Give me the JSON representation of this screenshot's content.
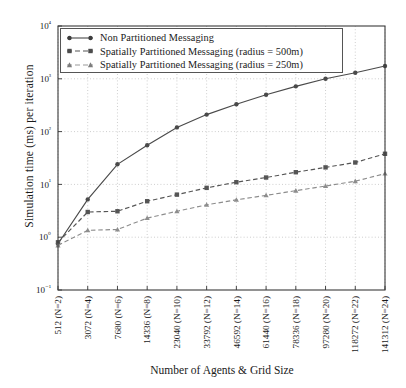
{
  "chart_data": {
    "type": "line",
    "title": "",
    "xlabel": "Number of Agents & Grid Size",
    "ylabel": "Simulation time (ms) per iteration",
    "yscale": "log",
    "ylim": [
      0.1,
      10000
    ],
    "ytick_labels": [
      "10⁴",
      "10³",
      "10²",
      "10¹",
      "10⁰",
      "10⁻¹"
    ],
    "ytick_values": [
      10000,
      1000,
      100,
      10,
      1,
      0.1
    ],
    "grid": true,
    "legend_position": "upper left",
    "categories": [
      "512 (N=2)",
      "3072 (N=4)",
      "7680 (N=6)",
      "14336 (N=8)",
      "23040 (N=10)",
      "33792 (N=12)",
      "46592 (N=14)",
      "61440 (N=16)",
      "78336 (N=18)",
      "97280 (N=20)",
      "118272 (N=22)",
      "141312 (N=24)"
    ],
    "x_agents": [
      512,
      3072,
      7680,
      14336,
      23040,
      33792,
      46592,
      61440,
      78336,
      97280,
      118272,
      141312
    ],
    "x_grid_n": [
      2,
      4,
      6,
      8,
      10,
      12,
      14,
      16,
      18,
      20,
      22,
      24
    ],
    "series": [
      {
        "name": "Non Partitioned Messaging",
        "marker": "circle",
        "linestyle": "solid",
        "color": "#4a4a4a",
        "values": [
          0.75,
          5.2,
          24.0,
          55.0,
          120.0,
          210.0,
          330.0,
          500.0,
          720.0,
          1000.0,
          1300.0,
          1750.0
        ]
      },
      {
        "name": "Spatially Partitioned Messaging (radius = 500m)",
        "marker": "square",
        "linestyle": "dashed",
        "color": "#555555",
        "values": [
          0.8,
          3.0,
          3.1,
          4.8,
          6.4,
          8.6,
          11.0,
          13.5,
          17.0,
          21.0,
          26.0,
          38.0
        ]
      },
      {
        "name": "Spatially Partitioned Messaging (radius = 250m)",
        "marker": "triangle",
        "linestyle": "dashed",
        "color": "#8d8d8d",
        "values": [
          0.7,
          1.35,
          1.4,
          2.3,
          3.1,
          4.1,
          5.1,
          6.2,
          7.6,
          9.3,
          11.5,
          16.0
        ]
      }
    ]
  },
  "legend": {
    "items": [
      {
        "label": "Non Partitioned Messaging"
      },
      {
        "label": "Spatially Partitioned Messaging (radius = 500m)"
      },
      {
        "label": "Spatially Partitioned Messaging (radius = 250m)"
      }
    ]
  }
}
